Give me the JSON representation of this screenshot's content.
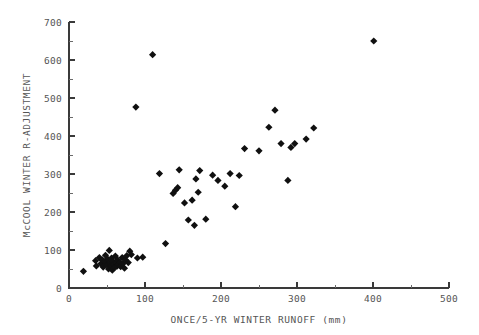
{
  "chart_data": {
    "type": "scatter",
    "title": "",
    "subtitle": "",
    "xlabel": "ONCE/5-YR WINTER RUNOFF (mm)",
    "ylabel": "McCOOL WINTER R-ADJUSTMENT",
    "xlim": [
      0,
      500
    ],
    "ylim": [
      0,
      700
    ],
    "x_major_ticks": [
      0,
      100,
      200,
      300,
      400,
      500
    ],
    "y_major_ticks": [
      0,
      100,
      200,
      300,
      400,
      500,
      600,
      700
    ],
    "x_minor_ticks": [
      50,
      150,
      250,
      350,
      450
    ],
    "y_minor_ticks": [
      50,
      150,
      250,
      350,
      450,
      550,
      650
    ],
    "x_tick_labels": [
      "0",
      "100",
      "200",
      "300",
      "400",
      "500"
    ],
    "y_tick_labels": [
      "0",
      "100",
      "200",
      "300",
      "400",
      "500",
      "600",
      "700"
    ],
    "grid": false,
    "legend": null,
    "marker_style": "filled-diamond",
    "marker_color": "#101010",
    "axis_color": "#3a3a3a",
    "background_color": "#ffffff",
    "series": [
      {
        "name": "stations",
        "points": [
          [
            19,
            44
          ],
          [
            35,
            72
          ],
          [
            36,
            58
          ],
          [
            40,
            80
          ],
          [
            42,
            64
          ],
          [
            44,
            74
          ],
          [
            45,
            55
          ],
          [
            47,
            69
          ],
          [
            48,
            86
          ],
          [
            50,
            61
          ],
          [
            51,
            76
          ],
          [
            52,
            50
          ],
          [
            53,
            99
          ],
          [
            54,
            66
          ],
          [
            55,
            58
          ],
          [
            56,
            79
          ],
          [
            57,
            47
          ],
          [
            58,
            70
          ],
          [
            59,
            62
          ],
          [
            60,
            54
          ],
          [
            61,
            84
          ],
          [
            62,
            66
          ],
          [
            63,
            57
          ],
          [
            64,
            74
          ],
          [
            65,
            62
          ],
          [
            67,
            68
          ],
          [
            68,
            56
          ],
          [
            70,
            80
          ],
          [
            71,
            64
          ],
          [
            73,
            52
          ],
          [
            74,
            75
          ],
          [
            76,
            85
          ],
          [
            78,
            67
          ],
          [
            80,
            97
          ],
          [
            82,
            88
          ],
          [
            88,
            476
          ],
          [
            90,
            79
          ],
          [
            97,
            81
          ],
          [
            110,
            614
          ],
          [
            119,
            301
          ],
          [
            127,
            117
          ],
          [
            137,
            249
          ],
          [
            140,
            257
          ],
          [
            143,
            264
          ],
          [
            145,
            311
          ],
          [
            152,
            224
          ],
          [
            157,
            179
          ],
          [
            162,
            231
          ],
          [
            165,
            165
          ],
          [
            167,
            287
          ],
          [
            170,
            252
          ],
          [
            172,
            309
          ],
          [
            180,
            181
          ],
          [
            189,
            297
          ],
          [
            196,
            283
          ],
          [
            205,
            268
          ],
          [
            212,
            301
          ],
          [
            219,
            214
          ],
          [
            224,
            296
          ],
          [
            231,
            367
          ],
          [
            250,
            361
          ],
          [
            263,
            423
          ],
          [
            271,
            468
          ],
          [
            279,
            380
          ],
          [
            288,
            283
          ],
          [
            292,
            370
          ],
          [
            297,
            380
          ],
          [
            312,
            392
          ],
          [
            322,
            421
          ],
          [
            401,
            650
          ]
        ]
      }
    ]
  },
  "axes_geometry": {
    "plot_left_px": 69,
    "plot_right_px": 449,
    "plot_top_px": 22,
    "plot_bottom_px": 288
  }
}
